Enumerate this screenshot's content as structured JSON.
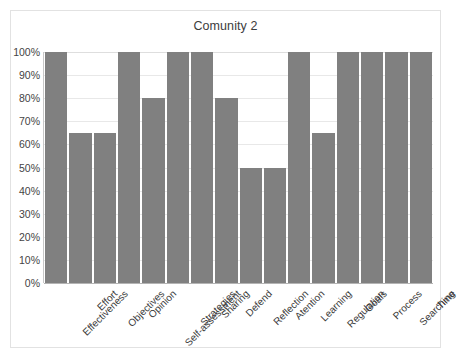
{
  "chart_data": {
    "type": "bar",
    "title": "Comunity 2",
    "xlabel": "",
    "ylabel": "",
    "ylim": [
      0,
      100
    ],
    "grid": true,
    "legend": "none",
    "bar_color": "#808080",
    "categories": [
      "Effectiveness",
      "Effort",
      "Objectives",
      "Opinion",
      "Self-assessment",
      "Strategies",
      "Sharing",
      "Defend",
      "Reflection",
      "Atention",
      "Learning",
      "Regulation",
      "Goals",
      "Process",
      "Searching",
      "Time"
    ],
    "values": [
      100,
      65,
      65,
      100,
      80,
      100,
      100,
      80,
      50,
      50,
      100,
      65,
      100,
      100,
      100,
      100
    ],
    "y_ticks": [
      0,
      10,
      20,
      30,
      40,
      50,
      60,
      70,
      80,
      90,
      100
    ],
    "y_tick_labels": [
      "0%",
      "10%",
      "20%",
      "30%",
      "40%",
      "50%",
      "60%",
      "70%",
      "80%",
      "90%",
      "100%"
    ]
  }
}
